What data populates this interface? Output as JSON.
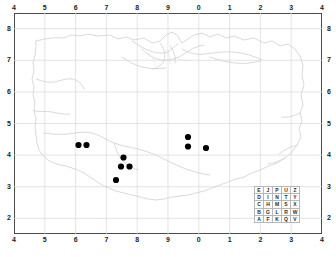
{
  "figure": {
    "type": "distribution-map",
    "background_color": "#ffffff",
    "frame_color": "#4b4b4b",
    "grid_color": "#d9d9d9",
    "coastline_color": "#cfcfcf",
    "dot_color": "#000000"
  },
  "axes": {
    "top_labels": [
      "4",
      "5",
      "6",
      "7",
      "8",
      "9",
      "0",
      "1",
      "2",
      "3",
      "4"
    ],
    "bottom_labels": [
      "4",
      "5",
      "6",
      "7",
      "8",
      "9",
      "0",
      "1",
      "2",
      "3",
      "4"
    ],
    "left_labels": [
      "8",
      "7",
      "6",
      "5",
      "4",
      "3",
      "2"
    ],
    "right_labels": [
      "8",
      "7",
      "6",
      "5",
      "4",
      "3",
      "2"
    ]
  },
  "legend": {
    "name": "grid-letter-square",
    "rows": [
      [
        "E",
        "J",
        "P",
        "U",
        "Z"
      ],
      [
        "D",
        "I",
        "N",
        "T",
        "Y"
      ],
      [
        "C",
        "H",
        "M",
        "S",
        "X"
      ],
      [
        "B",
        "G",
        "L",
        "R",
        "W"
      ],
      [
        "A",
        "F",
        "K",
        "Q",
        "V"
      ]
    ]
  },
  "chart_data": {
    "type": "scatter",
    "title": "",
    "xlabel": "",
    "ylabel": "",
    "xlim": [
      0,
      10
    ],
    "ylim": [
      0,
      7
    ],
    "grid": true,
    "legend_position": "bottom-right",
    "x_tick_labels": [
      "4",
      "5",
      "6",
      "7",
      "8",
      "9",
      "0",
      "1",
      "2",
      "3",
      "4"
    ],
    "y_tick_labels": [
      "8",
      "7",
      "6",
      "5",
      "4",
      "3",
      "2"
    ],
    "marker": "filled-circle",
    "marker_color": "#000000",
    "points": [
      {
        "px": 78.5,
        "py": 145.0,
        "label": "record-1"
      },
      {
        "px": 86.5,
        "py": 145.0,
        "label": "record-2"
      },
      {
        "px": 123.5,
        "py": 157.5,
        "label": "record-3"
      },
      {
        "px": 121.0,
        "py": 166.5,
        "label": "record-4"
      },
      {
        "px": 129.5,
        "py": 166.5,
        "label": "record-5"
      },
      {
        "px": 116.0,
        "py": 180.0,
        "label": "record-6"
      },
      {
        "px": 188.0,
        "py": 137.0,
        "label": "record-7"
      },
      {
        "px": 188.0,
        "py": 146.5,
        "label": "record-8"
      },
      {
        "px": 206.0,
        "py": 148.0,
        "label": "record-9"
      }
    ]
  }
}
